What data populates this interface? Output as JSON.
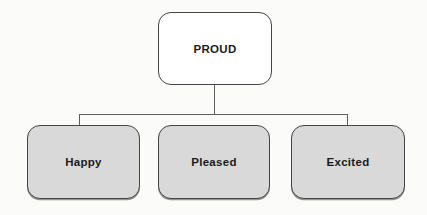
{
  "diagram": {
    "type": "tree",
    "root": {
      "label": "PROUD"
    },
    "children": [
      {
        "label": "Happy"
      },
      {
        "label": "Pleased"
      },
      {
        "label": "Excited"
      }
    ],
    "colors": {
      "background": "#fbfbf9",
      "root_fill": "#ffffff",
      "child_fill": "#d9d9d9",
      "border": "#454545",
      "connector": "#5e5e5e",
      "text": "#1b1b1b"
    }
  }
}
